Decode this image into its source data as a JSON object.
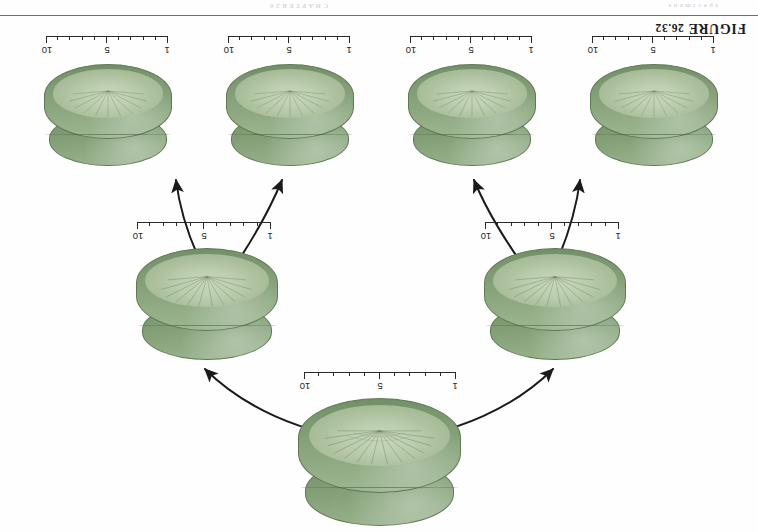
{
  "page": {
    "figure_label_prefix": "FIGURE",
    "figure_number": "26.32",
    "bleed_text_left": "C H A P T E R   2 6",
    "bleed_text_right": "s p e c i m e n s",
    "background_color": "#fefefe",
    "rule_color": "#555555",
    "orientation": "upside-down"
  },
  "colors": {
    "specimen_top_dark": "#6e8c63",
    "specimen_top_light": "#9fb794",
    "specimen_body_dark": "#718e66",
    "specimen_body_light": "#a0b895",
    "underside_light": "#cfdcc2",
    "outline": "#5d7a53",
    "arrow": "#1a1a1a",
    "tick": "#2a2a2a"
  },
  "scale_bars": [
    {
      "id": "scale-top-1",
      "labels": [
        "1",
        "5",
        "10"
      ],
      "minor_divisions": 10,
      "major_at": [
        1,
        5,
        10
      ],
      "unit_hint": ""
    },
    {
      "id": "scale-top-2",
      "labels": [
        "1",
        "5",
        "10"
      ],
      "minor_divisions": 10,
      "major_at": [
        1,
        5,
        10
      ],
      "unit_hint": ""
    },
    {
      "id": "scale-top-3",
      "labels": [
        "1",
        "5",
        "10"
      ],
      "minor_divisions": 10,
      "major_at": [
        1,
        5,
        10
      ],
      "unit_hint": ""
    },
    {
      "id": "scale-top-4",
      "labels": [
        "1",
        "5",
        "10"
      ],
      "minor_divisions": 10,
      "major_at": [
        1,
        5,
        10
      ],
      "unit_hint": ""
    },
    {
      "id": "scale-mid-left",
      "labels": [
        "1",
        "5",
        "10"
      ],
      "minor_divisions": 10,
      "major_at": [
        1,
        5,
        10
      ],
      "unit_hint": ""
    },
    {
      "id": "scale-mid-right",
      "labels": [
        "1",
        "5",
        "10"
      ],
      "minor_divisions": 10,
      "major_at": [
        1,
        5,
        10
      ],
      "unit_hint": ""
    },
    {
      "id": "scale-bottom",
      "labels": [
        "1",
        "5",
        "10"
      ],
      "minor_divisions": 10,
      "major_at": [
        1,
        5,
        10
      ],
      "unit_hint": ""
    }
  ],
  "specimens": [
    {
      "id": "specimen-top-1",
      "row": "top",
      "position": 1
    },
    {
      "id": "specimen-top-2",
      "row": "top",
      "position": 2
    },
    {
      "id": "specimen-top-3",
      "row": "top",
      "position": 3
    },
    {
      "id": "specimen-top-4",
      "row": "top",
      "position": 4
    },
    {
      "id": "specimen-mid-left",
      "row": "middle",
      "position": 1
    },
    {
      "id": "specimen-mid-right",
      "row": "middle",
      "position": 2
    },
    {
      "id": "specimen-bottom",
      "row": "bottom",
      "position": 1
    }
  ],
  "arrows": [
    {
      "id": "arrow-mid-left-to-top-1",
      "from": "specimen-mid-left",
      "to": "specimen-top-1"
    },
    {
      "id": "arrow-mid-left-to-top-2",
      "from": "specimen-mid-left",
      "to": "specimen-top-2"
    },
    {
      "id": "arrow-mid-right-to-top-3",
      "from": "specimen-mid-right",
      "to": "specimen-top-3"
    },
    {
      "id": "arrow-mid-right-to-top-4",
      "from": "specimen-mid-right",
      "to": "specimen-top-4"
    },
    {
      "id": "arrow-bottom-to-mid-left",
      "from": "specimen-bottom",
      "to": "specimen-mid-left"
    },
    {
      "id": "arrow-bottom-to-mid-right",
      "from": "specimen-bottom",
      "to": "specimen-mid-right"
    }
  ]
}
